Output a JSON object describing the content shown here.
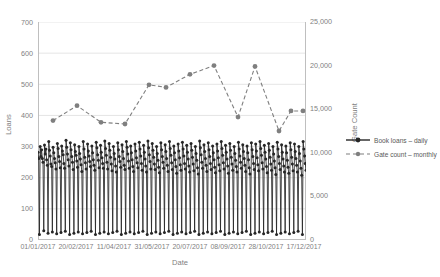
{
  "chart_data": {
    "type": "line",
    "title": "",
    "xlabel": "Date",
    "ylabel": "Loans",
    "y2label": "Gate Count",
    "ylim": [
      0,
      700
    ],
    "y2lim": [
      0,
      25000
    ],
    "grid": true,
    "legend_position": "right",
    "y_ticks": [
      "0",
      "100",
      "200",
      "300",
      "400",
      "500",
      "600",
      "700"
    ],
    "y2_ticks": [
      "0",
      "5,000",
      "10,000",
      "15,000",
      "20,000",
      "25,000"
    ],
    "x_ticks": [
      "01/01/2017",
      "20/02/2017",
      "11/04/2017",
      "31/05/2017",
      "20/07/2017",
      "08/09/2017",
      "28/10/2017",
      "17/12/2017"
    ],
    "series": [
      {
        "name": "Book loans – daily",
        "axis": "left",
        "style": "solid-line-with-markers",
        "color": "#262626",
        "values": [
          282,
          262,
          18,
          300,
          268,
          290,
          262,
          250,
          30,
          305,
          276,
          292,
          258,
          240,
          22,
          316,
          288,
          270,
          244,
          236,
          26,
          298,
          280,
          262,
          248,
          228,
          20,
          310,
          294,
          268,
          252,
          232,
          24,
          302,
          286,
          274,
          246,
          230,
          28,
          320,
          298,
          276,
          258,
          238,
          18,
          312,
          290,
          268,
          250,
          226,
          22,
          306,
          284,
          272,
          254,
          234,
          26,
          300,
          278,
          260,
          242,
          220,
          20,
          316,
          292,
          266,
          248,
          228,
          24,
          308,
          286,
          270,
          252,
          236,
          28,
          302,
          280,
          258,
          240,
          224,
          18,
          314,
          296,
          274,
          256,
          232,
          22,
          304,
          282,
          264,
          246,
          230,
          26,
          318,
          294,
          272,
          250,
          228,
          20,
          310,
          288,
          266,
          244,
          222,
          24,
          300,
          278,
          260,
          238,
          218,
          28,
          312,
          290,
          268,
          252,
          234,
          18,
          306,
          284,
          262,
          240,
          226,
          22,
          316,
          298,
          276,
          254,
          230,
          26,
          302,
          280,
          258,
          236,
          220,
          20,
          308,
          286,
          264,
          248,
          232,
          24,
          314,
          292,
          270,
          246,
          224,
          28,
          304,
          282,
          260,
          238,
          218,
          18,
          318,
          296,
          274,
          252,
          228,
          22,
          310,
          288,
          266,
          244,
          226,
          26,
          300,
          278,
          256,
          234,
          216,
          20,
          312,
          290,
          268,
          250,
          230,
          24,
          306,
          284,
          262,
          240,
          220,
          28,
          316,
          294,
          272,
          248,
          226,
          18,
          302,
          280,
          258,
          236,
          214,
          22,
          308,
          286,
          264,
          242,
          224,
          26,
          314,
          292,
          270,
          246,
          228,
          20,
          304,
          282,
          260,
          238,
          218,
          24,
          310,
          288,
          266,
          244,
          222,
          28,
          300,
          278,
          256,
          232,
          212,
          18,
          318,
          296,
          274,
          250,
          230,
          22,
          306,
          284,
          262,
          240,
          220,
          26,
          312,
          290,
          268,
          246,
          226,
          20,
          302,
          280,
          258,
          234,
          216,
          24,
          308,
          286,
          264,
          242,
          222,
          28,
          316,
          294,
          272,
          248,
          228,
          18,
          304,
          282,
          260,
          238,
          214,
          22,
          310,
          288,
          266,
          244,
          224,
          26,
          300,
          278,
          256,
          236,
          218,
          20,
          314,
          292,
          270,
          250,
          230,
          24,
          306,
          284,
          262,
          240,
          220,
          28,
          302,
          280,
          258,
          232,
          212,
          18,
          312,
          290,
          268,
          246,
          226,
          22,
          308,
          286,
          264,
          242,
          222,
          26,
          316,
          294,
          272,
          248,
          228,
          20,
          304,
          282,
          260,
          236,
          216,
          24,
          310,
          288,
          266,
          244,
          224,
          28,
          300,
          276,
          254,
          232,
          210,
          18,
          314,
          292,
          268,
          246,
          226,
          22,
          306,
          282,
          260,
          238,
          218,
          26,
          302,
          280,
          256,
          234,
          214,
          20,
          312,
          290,
          266,
          244,
          222,
          24,
          308,
          284,
          262,
          240,
          218,
          28,
          300,
          278,
          254,
          230,
          208,
          18,
          316,
          292,
          270,
          246,
          224
        ]
      },
      {
        "name": "Gate count – monthly",
        "axis": "right",
        "style": "dashed-line-with-markers",
        "color": "#7f7f7f",
        "values": [
          13700,
          15400,
          13500,
          13300,
          17800,
          17500,
          19000,
          20000,
          14100,
          19900,
          12500,
          14800,
          14800
        ],
        "x_positions": [
          15,
          39,
          63,
          87,
          111,
          128,
          152,
          176,
          200,
          217,
          241,
          253,
          265
        ]
      }
    ]
  },
  "legend": {
    "items": [
      {
        "label": "Book loans – daily",
        "marker": "solid-line-marker"
      },
      {
        "label": "Gate count – monthly",
        "marker": "dashed-line-marker"
      }
    ]
  },
  "colors": {
    "loans_series": "#262626",
    "gate_series": "#7f7f7f",
    "gridline": "#d9d9d9",
    "axis": "#bfbfbf",
    "text": "#7f7f7f"
  }
}
